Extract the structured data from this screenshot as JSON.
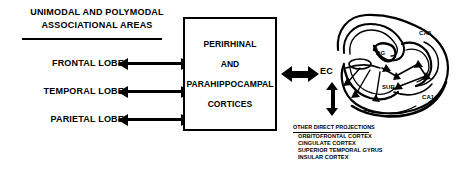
{
  "figure": {
    "type": "diagram"
  },
  "left_panel": {
    "header_line1": "UNIMODAL AND POLYMODAL",
    "header_line2": "ASSOCIATIONAL AREAS",
    "lobes": [
      {
        "label": "FRONTAL LOBE",
        "arrow": "bidirectional"
      },
      {
        "label": "TEMPORAL LOBE",
        "arrow": "bidirectional"
      },
      {
        "label": "PARIETAL LOBE",
        "arrow": "bidirectional"
      }
    ]
  },
  "center_box": {
    "lines": [
      "PERIRHINAL",
      "AND",
      "PARAHIPPOCAMPAL",
      "CORTICES"
    ]
  },
  "connector": {
    "box_to_ec": "bidirectional-thick-arrow",
    "ec_vertical": "bidirectional-arrow"
  },
  "entorhinal": {
    "label": "EC"
  },
  "projections": {
    "title": "OTHER DIRECT PROJECTIONS",
    "items": [
      "ORBITOFRONTAL CORTEX",
      "CINGULATE CORTEX",
      "SUPERIOR TEMPORAL GYRUS",
      "INSULAR CORTEX"
    ]
  },
  "hippocampus": {
    "labels": {
      "ca3": "CA3",
      "dg": "DG",
      "sub": "SUB",
      "ca1": "CA1"
    }
  },
  "colors": {
    "ink": "#000000",
    "paper": "#ffffff"
  }
}
